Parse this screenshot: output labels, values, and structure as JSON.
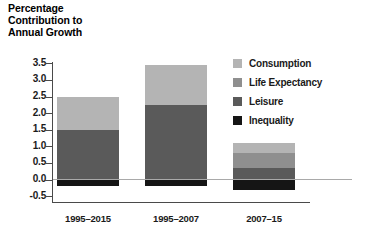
{
  "chart_data": {
    "type": "bar",
    "subtype": "stacked-bar",
    "title": "Percentage\nContribution to\nAnnual Growth",
    "xlabel": "",
    "ylabel": "",
    "ylim": [
      -0.75,
      3.75
    ],
    "yticks": [
      3.5,
      3.0,
      2.5,
      2.0,
      1.5,
      1.0,
      0.5,
      0.0,
      -0.5
    ],
    "ytick_labels": [
      "3.5",
      "3.0",
      "2.5",
      "2.0",
      "1.5",
      "1.0",
      "0.5",
      "0.0",
      "-0.5"
    ],
    "grid": false,
    "zero_line": true,
    "legend_position": "right",
    "categories": [
      "1995–2015",
      "1995–2007",
      "2007–15"
    ],
    "series": [
      {
        "name": "Consumption",
        "color": "#b4b4b4",
        "values": [
          1.0,
          1.2,
          0.3
        ]
      },
      {
        "name": "Life Expectancy",
        "color": "#8f8f8f",
        "values": [
          0.0,
          0.0,
          0.45
        ]
      },
      {
        "name": "Leisure",
        "color": "#5a5a5a",
        "values": [
          1.5,
          2.25,
          0.35
        ]
      },
      {
        "name": "Inequality",
        "color": "#151515",
        "values": [
          -0.2,
          -0.2,
          -0.3
        ]
      }
    ],
    "totals_positive": [
      2.5,
      3.45,
      1.1
    ]
  },
  "axis": {
    "tick_color": "#4a4a4a",
    "zero_line_color": "#a9a9a9"
  }
}
